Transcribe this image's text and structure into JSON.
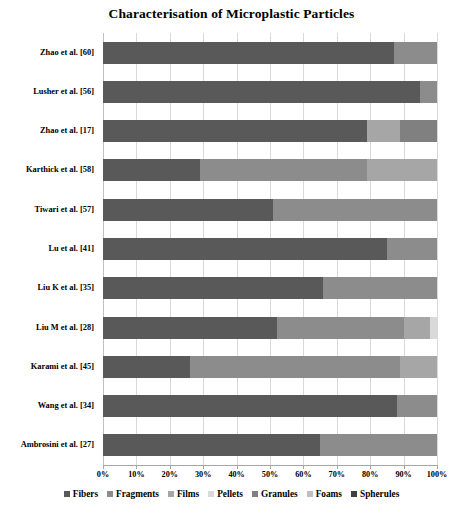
{
  "chart_data": {
    "type": "bar",
    "orientation": "horizontal",
    "stacked": true,
    "normalized_percent": true,
    "title": "Characterisation of Microplastic Particles",
    "xlabel": "",
    "ylabel": "",
    "xlim": [
      0,
      100
    ],
    "xticks": [
      "0%",
      "10%",
      "20%",
      "30%",
      "40%",
      "50%",
      "60%",
      "70%",
      "80%",
      "90%",
      "100%"
    ],
    "xtick_values": [
      0,
      10,
      20,
      30,
      40,
      50,
      60,
      70,
      80,
      90,
      100
    ],
    "grid": true,
    "grid_axis": "x",
    "legend_position": "bottom",
    "categories": [
      "Zhao et al. [60]",
      "Lusher et al. [56]",
      "Zhao et al. [17]",
      "Karthick et al. [58]",
      "Tiwari et al. [57]",
      "Lu et al. [41]",
      "Liu K et al. [35]",
      "Liu M et al. [28]",
      "Karami et al. [45]",
      "Wang et al. [34]",
      "Ambrosini et al. [27]"
    ],
    "series": [
      {
        "name": "Fibers",
        "color": "#595959",
        "values": [
          87,
          95,
          79,
          29,
          51,
          85,
          66,
          52,
          26,
          88,
          65
        ]
      },
      {
        "name": "Fragments",
        "color": "#8c8c8c",
        "values": [
          13,
          5,
          0,
          50,
          49,
          15,
          34,
          38,
          63,
          12,
          35
        ]
      },
      {
        "name": "Films",
        "color": "#a6a6a6",
        "values": [
          0,
          0,
          10,
          21,
          0,
          0,
          0,
          8,
          11,
          0,
          0
        ]
      },
      {
        "name": "Pellets",
        "color": "#d9d9d9",
        "values": [
          0,
          0,
          0,
          0,
          0,
          0,
          0,
          2,
          0,
          0,
          0
        ]
      },
      {
        "name": "Granules",
        "color": "#808080",
        "values": [
          0,
          0,
          11,
          0,
          0,
          0,
          0,
          0,
          0,
          0,
          0
        ]
      },
      {
        "name": "Foams",
        "color": "#bfbfbf",
        "values": [
          0,
          0,
          0,
          0,
          0,
          0,
          0,
          0,
          0,
          0,
          0
        ]
      },
      {
        "name": "Spherules",
        "color": "#404040",
        "values": [
          0,
          0,
          0,
          0,
          0,
          0,
          0,
          0,
          0,
          0,
          0
        ]
      }
    ]
  },
  "legend": {
    "items": [
      {
        "label": "Fibers",
        "color": "#595959"
      },
      {
        "label": "Fragments",
        "color": "#8c8c8c"
      },
      {
        "label": "Films",
        "color": "#a6a6a6"
      },
      {
        "label": "Pellets",
        "color": "#d9d9d9"
      },
      {
        "label": "Granules",
        "color": "#808080"
      },
      {
        "label": "Foams",
        "color": "#bfbfbf"
      },
      {
        "label": "Spherules",
        "color": "#404040"
      }
    ]
  }
}
